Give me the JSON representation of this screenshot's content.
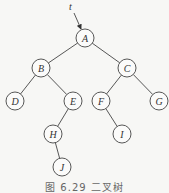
{
  "diagram": {
    "type": "binary-tree",
    "pointer": {
      "label": "t",
      "x": 69,
      "y": 10,
      "target": "A"
    },
    "node_radius": 9,
    "nodes": [
      {
        "id": "A",
        "label": "A",
        "x": 85,
        "y": 38
      },
      {
        "id": "B",
        "label": "B",
        "x": 41,
        "y": 68
      },
      {
        "id": "C",
        "label": "C",
        "x": 127,
        "y": 68
      },
      {
        "id": "D",
        "label": "D",
        "x": 15,
        "y": 101
      },
      {
        "id": "E",
        "label": "E",
        "x": 73,
        "y": 101
      },
      {
        "id": "F",
        "label": "F",
        "x": 101,
        "y": 101
      },
      {
        "id": "G",
        "label": "G",
        "x": 159,
        "y": 101
      },
      {
        "id": "H",
        "label": "H",
        "x": 53,
        "y": 134
      },
      {
        "id": "I",
        "label": "I",
        "x": 122,
        "y": 134
      },
      {
        "id": "J",
        "label": "J",
        "x": 62,
        "y": 167
      }
    ],
    "edges": [
      [
        "A",
        "B"
      ],
      [
        "A",
        "C"
      ],
      [
        "B",
        "D"
      ],
      [
        "B",
        "E"
      ],
      [
        "C",
        "F"
      ],
      [
        "C",
        "G"
      ],
      [
        "E",
        "H"
      ],
      [
        "F",
        "I"
      ],
      [
        "H",
        "J"
      ]
    ]
  },
  "caption": "图 6.29   二叉树"
}
